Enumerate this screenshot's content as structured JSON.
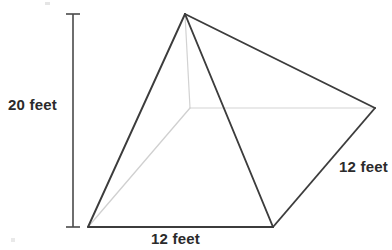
{
  "figure": {
    "shape_name": "square-pyramid",
    "background_color": "#ffffff",
    "edge_color": "#3a3a3a",
    "hidden_edge_color": "#cccccc",
    "ruler_color": "#4a4a4a",
    "label_color": "#2b2b2b",
    "vertices": {
      "apex": [
        185,
        14
      ],
      "base_front_left": [
        88,
        227
      ],
      "base_front_right": [
        273,
        227
      ],
      "base_right": [
        375,
        108
      ],
      "base_back_hidden": [
        190,
        108
      ]
    },
    "visible_edges": [
      [
        185,
        14,
        88,
        227
      ],
      [
        185,
        14,
        273,
        227
      ],
      [
        185,
        14,
        375,
        108
      ],
      [
        88,
        227,
        273,
        227
      ],
      [
        273,
        227,
        375,
        108
      ]
    ],
    "hidden_edges": [
      [
        185,
        14,
        190,
        108
      ],
      [
        190,
        108,
        88,
        227
      ],
      [
        190,
        108,
        375,
        108
      ]
    ],
    "height_ruler": {
      "x": 73,
      "y_top": 14,
      "y_bottom": 227,
      "tick_half_width": 7
    }
  },
  "labels": {
    "height": "20 feet",
    "base_front": "12 feet",
    "base_right": "12 feet"
  }
}
